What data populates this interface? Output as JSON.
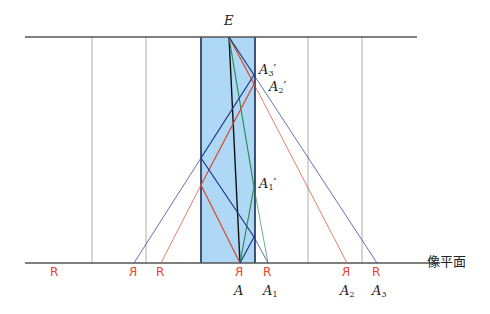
{
  "diagram": {
    "title": "",
    "colors": {
      "plane_line": "#555555",
      "guide_line": "#9a9a9a",
      "slab_fill": "#aed8f5",
      "slab_edge": "#1a2a55",
      "ray_blue": "#1f3b8a",
      "ray_red": "#d9482f",
      "ray_green": "#2e8b57",
      "ray_black": "#111111",
      "object_glyph": "#e8432e"
    },
    "labels": {
      "eye": "E",
      "image_plane": "像平面",
      "A": "A",
      "A1": "A",
      "A1_sub": "1",
      "A2": "A",
      "A2_sub": "2",
      "A3": "A",
      "A3_sub": "3",
      "A1p": "A",
      "A1p_sub": "1",
      "A2p": "A",
      "A2p_sub": "2",
      "A3p": "A",
      "A3p_sub": "3",
      "prime": "′"
    },
    "objects": [
      {
        "glyph": "R",
        "mirrored": false,
        "x": 55
      },
      {
        "glyph": "R",
        "mirrored": true,
        "x": 134
      },
      {
        "glyph": "R",
        "mirrored": false,
        "x": 161
      },
      {
        "glyph": "R",
        "mirrored": true,
        "x": 240
      },
      {
        "glyph": "R",
        "mirrored": false,
        "x": 268
      },
      {
        "glyph": "R",
        "mirrored": true,
        "x": 347
      },
      {
        "glyph": "R",
        "mirrored": false,
        "x": 377
      }
    ]
  }
}
